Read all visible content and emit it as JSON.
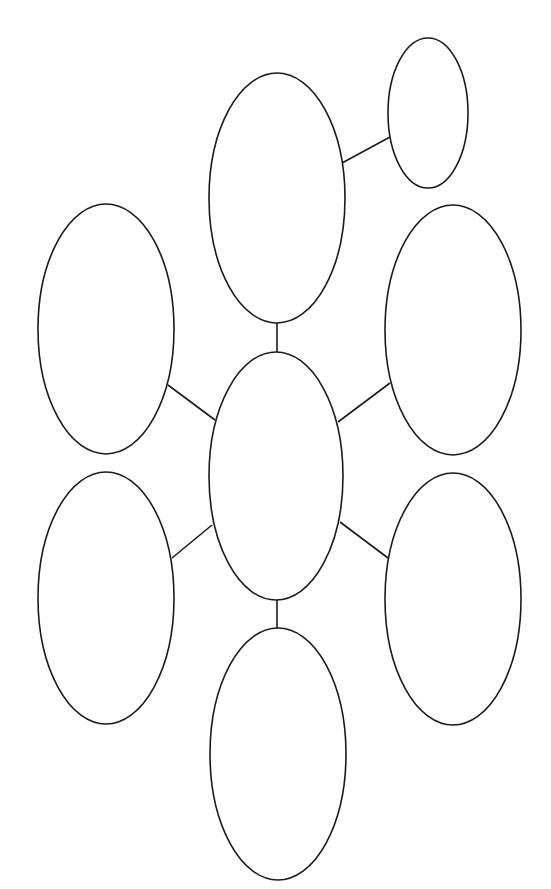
{
  "diagram": {
    "type": "graphic-organizer-web",
    "background": "#ffffff",
    "stroke_color": "#1a1a1a",
    "nodes": [
      {
        "id": "center",
        "role": "central-topic",
        "cx": 276,
        "cy": 476,
        "rx": 67,
        "ry": 124,
        "label": ""
      },
      {
        "id": "top",
        "role": "branch",
        "cx": 277,
        "cy": 198,
        "rx": 68,
        "ry": 125,
        "label": ""
      },
      {
        "id": "top-sub",
        "role": "sub-branch",
        "cx": 428,
        "cy": 113,
        "rx": 40,
        "ry": 75,
        "label": ""
      },
      {
        "id": "upper-left",
        "role": "branch",
        "cx": 106,
        "cy": 329,
        "rx": 68,
        "ry": 125,
        "label": ""
      },
      {
        "id": "upper-right",
        "role": "branch",
        "cx": 453,
        "cy": 330,
        "rx": 68,
        "ry": 125,
        "label": ""
      },
      {
        "id": "lower-left",
        "role": "branch",
        "cx": 106,
        "cy": 598,
        "rx": 68,
        "ry": 126,
        "label": ""
      },
      {
        "id": "lower-right",
        "role": "branch",
        "cx": 453,
        "cy": 599,
        "rx": 68,
        "ry": 126,
        "label": ""
      },
      {
        "id": "bottom",
        "role": "branch",
        "cx": 278,
        "cy": 754,
        "rx": 68,
        "ry": 126,
        "label": ""
      }
    ],
    "edges": [
      {
        "from": "center",
        "to": "top",
        "x1": 277,
        "y1": 352,
        "x2": 277,
        "y2": 323
      },
      {
        "from": "top",
        "to": "top-sub",
        "x1": 342,
        "y1": 163,
        "x2": 390,
        "y2": 137
      },
      {
        "from": "center",
        "to": "upper-left",
        "x1": 215,
        "y1": 420,
        "x2": 168,
        "y2": 385
      },
      {
        "from": "center",
        "to": "upper-right",
        "x1": 338,
        "y1": 422,
        "x2": 390,
        "y2": 383
      },
      {
        "from": "center",
        "to": "lower-left",
        "x1": 212,
        "y1": 525,
        "x2": 172,
        "y2": 558
      },
      {
        "from": "center",
        "to": "lower-right",
        "x1": 340,
        "y1": 522,
        "x2": 388,
        "y2": 558
      },
      {
        "from": "center",
        "to": "bottom",
        "x1": 277,
        "y1": 600,
        "x2": 277,
        "y2": 628
      }
    ]
  }
}
